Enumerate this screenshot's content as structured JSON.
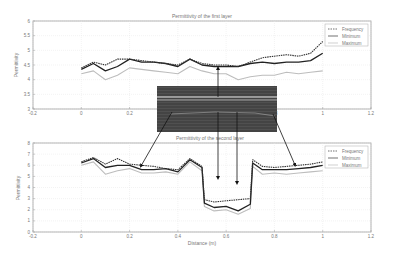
{
  "figure": {
    "top_title": "Permittivity of the first layer",
    "bottom_title": "Permittivity of the second layer",
    "ylabel": "Permittivity",
    "xlabel": "Distance (m)"
  },
  "legend": [
    "Frequency",
    "Minimum",
    "Maximum"
  ],
  "chart_data": [
    {
      "type": "line",
      "title": "Permittivity of the first layer",
      "xlabel": "",
      "ylabel": "Permittivity",
      "xlim": [
        -0.2,
        1.2
      ],
      "ylim": [
        3,
        6
      ],
      "xticks": [
        "-0.2",
        "0",
        "0.2",
        "0.4",
        "0.6",
        "0.8",
        "1",
        "1.2"
      ],
      "yticks": [
        "3",
        "3.5",
        "4",
        "4.5",
        "5",
        "5.5",
        "6"
      ],
      "grid": true,
      "legend_position": "upper right",
      "x": [
        0,
        0.05,
        0.1,
        0.15,
        0.2,
        0.25,
        0.3,
        0.35,
        0.4,
        0.45,
        0.5,
        0.55,
        0.6,
        0.65,
        0.7,
        0.75,
        0.8,
        0.85,
        0.9,
        0.95,
        1.0
      ],
      "series": [
        {
          "name": "Frequency",
          "values": [
            4.4,
            4.6,
            4.5,
            4.7,
            4.7,
            4.65,
            4.6,
            4.55,
            4.5,
            4.7,
            4.55,
            4.5,
            4.5,
            4.45,
            4.6,
            4.75,
            4.8,
            4.85,
            4.8,
            4.9,
            5.3
          ]
        },
        {
          "name": "Minimum",
          "values": [
            4.35,
            4.55,
            4.3,
            4.45,
            4.7,
            4.6,
            4.6,
            4.55,
            4.45,
            4.7,
            4.5,
            4.45,
            4.45,
            4.45,
            4.55,
            4.6,
            4.55,
            4.6,
            4.6,
            4.65,
            4.9
          ]
        },
        {
          "name": "Maximum",
          "values": [
            4.2,
            4.3,
            4.0,
            4.15,
            4.4,
            4.35,
            4.3,
            4.25,
            4.2,
            4.45,
            4.3,
            4.2,
            4.2,
            4.0,
            4.1,
            4.15,
            4.15,
            4.25,
            4.2,
            4.25,
            4.3
          ]
        }
      ]
    },
    {
      "type": "line",
      "title": "Permittivity of the second layer",
      "xlabel": "Distance (m)",
      "ylabel": "Permittivity",
      "xlim": [
        -0.2,
        1.2
      ],
      "ylim": [
        0,
        8
      ],
      "xticks": [
        "-0.2",
        "0",
        "0.2",
        "0.4",
        "0.6",
        "0.8",
        "1",
        "1.2"
      ],
      "yticks": [
        "0",
        "1",
        "2",
        "3",
        "4",
        "5",
        "6",
        "7",
        "8"
      ],
      "grid": true,
      "legend_position": "upper right",
      "x": [
        0,
        0.05,
        0.1,
        0.15,
        0.2,
        0.25,
        0.3,
        0.35,
        0.4,
        0.45,
        0.5,
        0.51,
        0.55,
        0.6,
        0.65,
        0.7,
        0.71,
        0.75,
        0.8,
        0.85,
        0.9,
        0.95,
        1.0
      ],
      "series": [
        {
          "name": "Frequency",
          "values": [
            6.3,
            6.7,
            6.1,
            6.6,
            6.1,
            6.0,
            5.9,
            5.7,
            5.6,
            6.6,
            5.9,
            2.9,
            2.7,
            2.8,
            2.9,
            3.0,
            6.5,
            5.9,
            5.8,
            5.9,
            6.0,
            6.1,
            6.3
          ]
        },
        {
          "name": "Minimum",
          "values": [
            6.2,
            6.6,
            5.8,
            6.0,
            6.0,
            5.6,
            5.6,
            5.7,
            5.4,
            6.5,
            5.8,
            2.6,
            2.2,
            2.3,
            1.9,
            2.5,
            6.2,
            5.6,
            5.6,
            5.6,
            5.7,
            5.8,
            6.0
          ]
        },
        {
          "name": "Maximum",
          "values": [
            6.0,
            6.3,
            5.2,
            5.5,
            5.7,
            5.3,
            5.3,
            5.4,
            5.2,
            6.3,
            5.5,
            2.3,
            1.9,
            2.0,
            1.6,
            2.1,
            5.9,
            5.2,
            5.3,
            5.2,
            5.3,
            5.4,
            5.5
          ]
        }
      ]
    }
  ]
}
